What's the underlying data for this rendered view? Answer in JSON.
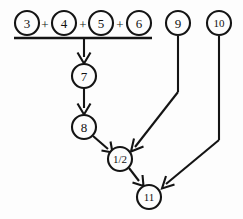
{
  "diagram": {
    "background_color": "#fdfdfd",
    "stroke_color": "#141414",
    "nodes": [
      {
        "id": "n3",
        "label": "3",
        "cx": 27,
        "cy": 23,
        "r": 12
      },
      {
        "id": "n4",
        "label": "4",
        "cx": 64,
        "cy": 23,
        "r": 12
      },
      {
        "id": "n5",
        "label": "5",
        "cx": 101,
        "cy": 23,
        "r": 12
      },
      {
        "id": "n6",
        "label": "6",
        "cx": 139,
        "cy": 23,
        "r": 12
      },
      {
        "id": "n9",
        "label": "9",
        "cx": 178,
        "cy": 23,
        "r": 12
      },
      {
        "id": "n10",
        "label": "10",
        "cx": 219,
        "cy": 23,
        "r": 12
      },
      {
        "id": "n7",
        "label": "7",
        "cx": 84,
        "cy": 76,
        "r": 12
      },
      {
        "id": "n8",
        "label": "8",
        "cx": 84,
        "cy": 127,
        "r": 12
      },
      {
        "id": "nh",
        "label": "1/2",
        "cx": 120,
        "cy": 159,
        "r": 12
      },
      {
        "id": "n11",
        "label": "11",
        "cx": 149,
        "cy": 197,
        "r": 12
      }
    ],
    "operators": [
      {
        "label": "+",
        "x": 45,
        "y": 24
      },
      {
        "label": "+",
        "x": 83,
        "y": 24
      },
      {
        "label": "+",
        "x": 120,
        "y": 24
      }
    ],
    "sum_bar": {
      "x1": 14,
      "x2": 152,
      "y": 38
    },
    "edges": [
      {
        "id": "e-sum-7",
        "from": "sum-bar",
        "to": "n7",
        "arrow": true
      },
      {
        "id": "e-7-8",
        "from": "n7",
        "to": "n8",
        "arrow": true
      },
      {
        "id": "e-8-half",
        "from": "n8",
        "to": "nh",
        "arrow": true
      },
      {
        "id": "e-9-half",
        "from": "n9",
        "to": "nh",
        "arrow": true
      },
      {
        "id": "e-half-11",
        "from": "nh",
        "to": "n11",
        "arrow": true
      },
      {
        "id": "e-10-11",
        "from": "n10",
        "to": "n11",
        "arrow": true
      }
    ]
  }
}
